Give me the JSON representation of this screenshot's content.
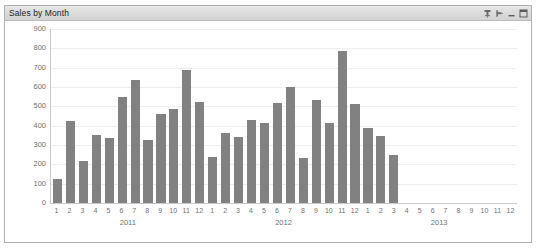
{
  "window": {
    "title": "Sales by Month",
    "controls": [
      {
        "name": "pin-icon",
        "label": "Pin"
      },
      {
        "name": "unpin-icon",
        "label": "Auto Hide"
      },
      {
        "name": "minimize-icon",
        "label": "Minimize"
      },
      {
        "name": "restore-icon",
        "label": "Restore"
      }
    ]
  },
  "colors": {
    "bar": "#818181",
    "axis": "#c8c8c8",
    "grid": "#ededed",
    "tick_text": "#6f6f6f",
    "titlebar": "#dcdcdc",
    "border": "#b0b0b0"
  },
  "chart_data": {
    "type": "bar",
    "title": "Sales by Month",
    "xlabel": "",
    "ylabel": "",
    "ylim": [
      0,
      900
    ],
    "yticks": [
      0,
      100,
      200,
      300,
      400,
      500,
      600,
      700,
      800,
      900
    ],
    "grid": true,
    "legend": "none",
    "groups": [
      {
        "label": "2011",
        "count": 12
      },
      {
        "label": "2012",
        "count": 12
      },
      {
        "label": "2013",
        "count": 12
      }
    ],
    "categories": [
      "1",
      "2",
      "3",
      "4",
      "5",
      "6",
      "7",
      "8",
      "9",
      "10",
      "11",
      "12",
      "1",
      "2",
      "3",
      "4",
      "5",
      "6",
      "7",
      "8",
      "9",
      "10",
      "11",
      "12",
      "1",
      "2",
      "3",
      "4",
      "5",
      "6",
      "7",
      "8",
      "9",
      "10",
      "11",
      "12"
    ],
    "values": [
      125,
      425,
      215,
      350,
      338,
      548,
      638,
      325,
      458,
      485,
      688,
      525,
      240,
      362,
      342,
      430,
      412,
      518,
      598,
      235,
      535,
      415,
      785,
      512,
      388,
      345,
      248,
      null,
      null,
      null,
      null,
      null,
      null,
      null,
      null,
      null
    ]
  }
}
